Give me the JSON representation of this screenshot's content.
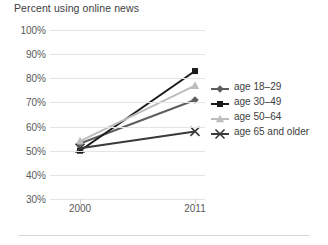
{
  "chart_data": {
    "type": "line",
    "title": "Percent using online news",
    "xlabel": "",
    "ylabel": "",
    "x": [
      "2000",
      "2011"
    ],
    "categories": [
      "2000",
      "2011"
    ],
    "series": [
      {
        "name": "age 18–29",
        "values": [
          53,
          71
        ],
        "color": "#5e5e5e",
        "marker": "diamond"
      },
      {
        "name": "age 30–49",
        "values": [
          50,
          83
        ],
        "color": "#1a1a1a",
        "marker": "square"
      },
      {
        "name": "age 50–64",
        "values": [
          54,
          77
        ],
        "color": "#bdbdbd",
        "marker": "triangle"
      },
      {
        "name": "age 65 and older",
        "values": [
          51,
          58
        ],
        "color": "#3a3a3a",
        "marker": "x"
      }
    ],
    "ylim": [
      30,
      100
    ],
    "ytick_labels": [
      "100%",
      "90%",
      "80%",
      "70%",
      "60%",
      "50%",
      "40%",
      "30%"
    ],
    "ytick_values": [
      100,
      90,
      80,
      70,
      60,
      50,
      40,
      30
    ],
    "grid": true,
    "legend_position": "right"
  },
  "colors": {
    "gridline": "#e4e4e4",
    "axis_text": "#5a5a5a",
    "title_text": "#3d3d3d",
    "background": "#ffffff",
    "footer_rule": "#d8d8d8"
  }
}
